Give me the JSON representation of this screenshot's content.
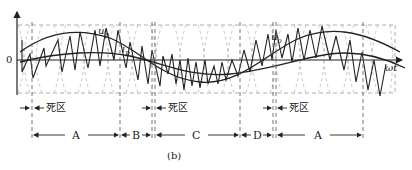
{
  "figure": {
    "caption": "(b)",
    "axis": {
      "origin_label": "0",
      "x_label": "ωt"
    },
    "curves": {
      "u_p_label": "u",
      "u_p_sub": "p",
      "i_p_label": "i",
      "i_p_sub": "p",
      "u_o_label": "u",
      "u_o_sub": "o"
    },
    "dead_zone_label": "死区",
    "dead_zones": [
      {
        "label": "死区",
        "x": 17
      },
      {
        "label": "死区",
        "x": 152
      },
      {
        "label": "死区",
        "x": 277
      }
    ],
    "intervals": [
      {
        "label": "A",
        "from": 32,
        "to": 120
      },
      {
        "label": "B",
        "from": 120,
        "to": 152
      },
      {
        "label": "C",
        "from": 155,
        "to": 240
      },
      {
        "label": "D",
        "from": 240,
        "to": 273
      },
      {
        "label": "A",
        "from": 276,
        "to": 363
      }
    ],
    "colors": {
      "line": "#222222",
      "dashed": "#888888"
    }
  }
}
